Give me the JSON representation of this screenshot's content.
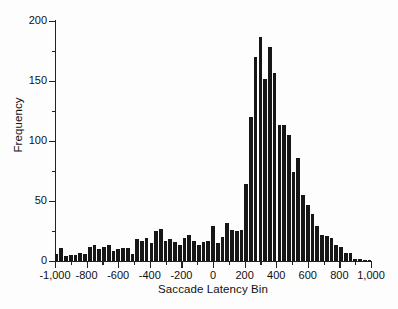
{
  "chart_data": {
    "type": "bar",
    "title": "",
    "subtitle": "",
    "xlabel": "Saccade Latency Bin",
    "ylabel": "Frequency",
    "xlim": [
      -1000,
      1000
    ],
    "ylim": [
      0,
      200
    ],
    "grid": false,
    "legend": null,
    "bar_color": "#161616",
    "bin_width": 30,
    "x_tick_labels": [
      "-1,000",
      "-800",
      "-600",
      "-400",
      "-200",
      "0",
      "200",
      "400",
      "600",
      "800",
      "1,000"
    ],
    "x_tick_values": [
      -1000,
      -800,
      -600,
      -400,
      -200,
      0,
      200,
      400,
      600,
      800,
      1000
    ],
    "x_minor_tick_values": [
      -900,
      -700,
      -500,
      -300,
      -100,
      100,
      300,
      500,
      700,
      900
    ],
    "y_tick_labels": [
      "0",
      "50",
      "100",
      "150",
      "200"
    ],
    "y_tick_values": [
      0,
      50,
      100,
      150,
      200
    ],
    "y_minor_tick_values": [
      25,
      75,
      125,
      175
    ],
    "categories": [
      -990,
      -960,
      -930,
      -900,
      -870,
      -840,
      -810,
      -780,
      -750,
      -720,
      -690,
      -660,
      -630,
      -600,
      -570,
      -540,
      -510,
      -480,
      -450,
      -420,
      -390,
      -360,
      -330,
      -300,
      -270,
      -240,
      -210,
      -180,
      -150,
      -120,
      -90,
      -60,
      -30,
      0,
      30,
      60,
      90,
      120,
      150,
      180,
      210,
      240,
      270,
      300,
      330,
      360,
      390,
      420,
      450,
      480,
      510,
      540,
      570,
      600,
      630,
      660,
      690,
      720,
      750,
      780,
      810,
      840,
      870,
      900,
      930,
      960,
      990
    ],
    "values": [
      6,
      11,
      4,
      5,
      5,
      7,
      6,
      12,
      13,
      10,
      12,
      13,
      8,
      10,
      11,
      11,
      6,
      18,
      17,
      19,
      15,
      25,
      27,
      17,
      18,
      16,
      13,
      19,
      22,
      17,
      13,
      16,
      17,
      29,
      15,
      20,
      32,
      26,
      25,
      26,
      64,
      120,
      170,
      187,
      152,
      178,
      157,
      113,
      113,
      105,
      74,
      86,
      55,
      47,
      39,
      29,
      22,
      21,
      19,
      13,
      12,
      7,
      7,
      2,
      2,
      1,
      1
    ]
  }
}
